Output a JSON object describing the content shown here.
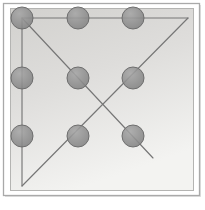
{
  "figure": {
    "canvas": {
      "width": 205,
      "height": 210
    },
    "colors": {
      "page_background": "#ffffff",
      "outer_frame_stroke": "#a9a9a9",
      "inner_panel_fill_top": "#d3d2cf",
      "inner_panel_fill_bottom": "#f1f1ef",
      "inner_panel_stroke": "#b4b4b2",
      "node_fill": "#8c8c8c",
      "node_stroke": "#6e6e6e",
      "line_stroke": "#767676",
      "shadow": "#c8c8c8"
    },
    "outer_frame": {
      "x": 3,
      "y": 3,
      "width": 196,
      "height": 192
    },
    "inner_panel": {
      "x": 10,
      "y": 8,
      "width": 183,
      "height": 182
    },
    "node_radius": 11,
    "nodes": [
      {
        "name": "node-top-left",
        "x": 22,
        "y": 18,
        "row": 0,
        "col": 0
      },
      {
        "name": "node-top-center",
        "x": 78,
        "y": 18,
        "row": 0,
        "col": 1
      },
      {
        "name": "node-top-right",
        "x": 133,
        "y": 18,
        "row": 0,
        "col": 2
      },
      {
        "name": "node-middle-left",
        "x": 22,
        "y": 78,
        "row": 1,
        "col": 0
      },
      {
        "name": "node-middle-center",
        "x": 78,
        "y": 78,
        "row": 1,
        "col": 1
      },
      {
        "name": "node-middle-right",
        "x": 133,
        "y": 78,
        "row": 1,
        "col": 2
      },
      {
        "name": "node-bottom-left",
        "x": 22,
        "y": 136,
        "row": 2,
        "col": 0
      },
      {
        "name": "node-bottom-center",
        "x": 78,
        "y": 136,
        "row": 2,
        "col": 1
      },
      {
        "name": "node-bottom-right",
        "x": 133,
        "y": 136,
        "row": 2,
        "col": 2
      }
    ],
    "lines": [
      {
        "name": "line-top-horizontal",
        "x1": 22,
        "y1": 18,
        "x2": 188,
        "y2": 18
      },
      {
        "name": "line-left-vertical",
        "x1": 22,
        "y1": 18,
        "x2": 22,
        "y2": 186
      },
      {
        "name": "line-main-diagonal",
        "x1": 22,
        "y1": 18,
        "x2": 153,
        "y2": 158
      },
      {
        "name": "line-anti-diagonal",
        "x1": 22,
        "y1": 186,
        "x2": 188,
        "y2": 18
      }
    ],
    "intersection": {
      "name": "diagonal-crossing-point",
      "x": 105,
      "y": 108
    }
  }
}
